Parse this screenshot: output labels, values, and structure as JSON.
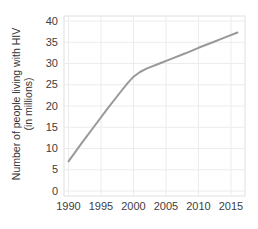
{
  "figure": {
    "background_color": "#ffffff"
  },
  "chart_data": {
    "type": "line",
    "title": "",
    "xlabel": "",
    "ylabel": "Number of people living with HIV (in millions)",
    "ylabel_line1": "Number of people living with HIV",
    "ylabel_line2": "(in millions)",
    "x_tick_labels": [
      "1990",
      "1995",
      "2000",
      "2005",
      "2010",
      "2015"
    ],
    "x_tick_values": [
      1990,
      1995,
      2000,
      2005,
      2010,
      2015
    ],
    "y_tick_labels": [
      "0",
      "5",
      "10",
      "15",
      "20",
      "25",
      "30",
      "35",
      "40"
    ],
    "y_tick_values": [
      0,
      5,
      10,
      15,
      20,
      25,
      30,
      35,
      40
    ],
    "ylim": [
      0,
      40
    ],
    "xlim": [
      1990,
      2016
    ],
    "grid": true,
    "legend_position": "none",
    "series": [
      {
        "name": "people-living-with-hiv",
        "points": [
          [
            1990,
            7.0
          ],
          [
            1992,
            11.2
          ],
          [
            1994,
            15.3
          ],
          [
            1996,
            19.4
          ],
          [
            1998,
            23.3
          ],
          [
            1999,
            25.2
          ],
          [
            2000,
            26.9
          ],
          [
            2001,
            28.0
          ],
          [
            2002,
            28.8
          ],
          [
            2004,
            30.0
          ],
          [
            2006,
            31.2
          ],
          [
            2008,
            32.4
          ],
          [
            2010,
            33.7
          ],
          [
            2012,
            34.9
          ],
          [
            2014,
            36.1
          ],
          [
            2016,
            37.3
          ]
        ]
      }
    ],
    "colors": {
      "line": "#999999",
      "grid": "#ececec",
      "frame": "#e0e0e0",
      "tick_text": "#404040",
      "axis_title_text": "#333333",
      "panel_background": "#ffffff"
    }
  }
}
